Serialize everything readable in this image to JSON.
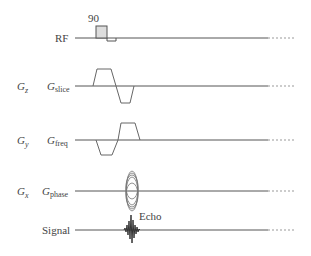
{
  "rows": [
    {
      "id": "rf",
      "axis": "",
      "label": "RF",
      "sub": ""
    },
    {
      "id": "slice",
      "axis": "G",
      "axis_sub": "z",
      "label": "G",
      "sub": "slice"
    },
    {
      "id": "freq",
      "axis": "G",
      "axis_sub": "y",
      "label": "G",
      "sub": "freq"
    },
    {
      "id": "phase",
      "axis": "G",
      "axis_sub": "x",
      "label": "G",
      "sub": "phase"
    },
    {
      "id": "signal",
      "axis": "",
      "label": "Signal",
      "sub": ""
    }
  ],
  "annotations": {
    "flip_angle": "90",
    "echo": "Echo"
  },
  "colors": {
    "line": "#555555",
    "pulse_fill": "#dddddd"
  }
}
